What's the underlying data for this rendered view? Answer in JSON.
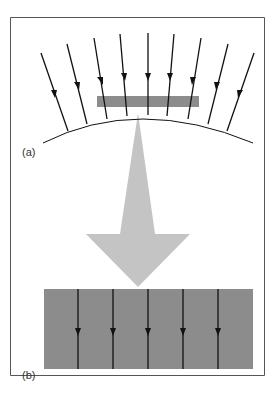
{
  "figure": {
    "panel_a": {
      "label": "(a)",
      "description": "Converging field lines arriving at a curved surface; a small grey slab intercepts them"
    },
    "panel_b": {
      "label": "(b)",
      "description": "Magnified slab with parallel field lines"
    },
    "colors": {
      "border": "#555555",
      "slab": "#8c8c8c",
      "arrow": "#c4c4c4",
      "lines": "#111111"
    },
    "top_lines_count": 9,
    "bottom_lines_count": 5
  }
}
